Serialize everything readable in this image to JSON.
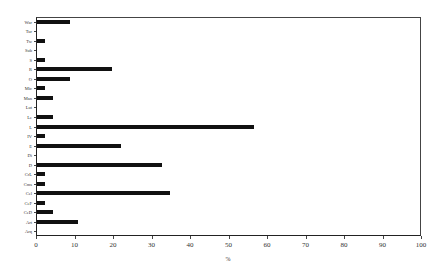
{
  "chart_data": {
    "type": "bar",
    "orientation": "horizontal",
    "title": "",
    "xlabel": "%",
    "ylabel": "",
    "xlim": [
      0,
      100
    ],
    "xticks": [
      0,
      10,
      20,
      30,
      40,
      50,
      60,
      70,
      80,
      90,
      100
    ],
    "grid": false,
    "legend": null,
    "categories": [
      "War",
      "Tur",
      "Tw",
      "Sub",
      "S",
      "R",
      "O",
      "Mic",
      "Man",
      "Lut",
      "Le",
      "L",
      "IV",
      "E",
      "Di",
      "D",
      "CrL",
      "Cms",
      "Cel",
      "CeF",
      "CeD",
      "Art",
      "Arq"
    ],
    "values": [
      8.8,
      0,
      2.3,
      0,
      2.3,
      19.7,
      8.8,
      2.3,
      4.3,
      0,
      4.3,
      56.5,
      2.3,
      22.0,
      0,
      32.7,
      2.3,
      2.3,
      34.8,
      2.3,
      4.3,
      10.8,
      0
    ]
  },
  "bar_color": "#111111"
}
